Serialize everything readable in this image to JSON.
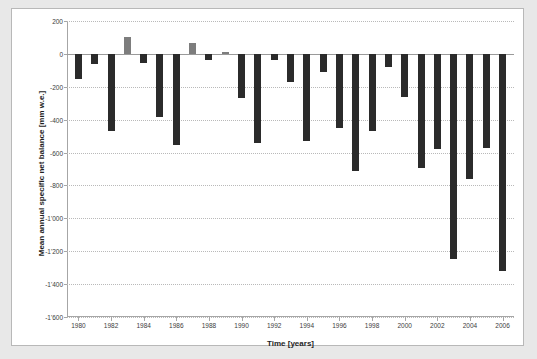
{
  "chart_data": {
    "type": "bar",
    "title": "",
    "xlabel": "Time [years]",
    "ylabel": "Mean annual specific net balance [mm w.e.]",
    "xlim": [
      1979.3,
      2006.7
    ],
    "ylim": [
      -1600,
      200
    ],
    "grid": true,
    "legend": "none",
    "y_ticks": [
      200,
      0,
      -200,
      -400,
      -600,
      -800,
      -1000,
      -1200,
      -1400,
      -1600
    ],
    "y_tick_labels": [
      "200",
      "0",
      "-200",
      "-400",
      "-600",
      "-800",
      "-1'000",
      "-1'200",
      "-1'400",
      "-1'600"
    ],
    "x_ticks": [
      1980,
      1982,
      1984,
      1986,
      1988,
      1990,
      1992,
      1994,
      1996,
      1998,
      2000,
      2002,
      2004,
      2006
    ],
    "x_tick_labels": [
      "1980",
      "1982",
      "1984",
      "1986",
      "1988",
      "1990",
      "1992",
      "1994",
      "1996",
      "1998",
      "2000",
      "2002",
      "2004",
      "2006"
    ],
    "categories": [
      1980,
      1981,
      1982,
      1983,
      1984,
      1985,
      1986,
      1987,
      1988,
      1989,
      1990,
      1991,
      1992,
      1993,
      1994,
      1995,
      1996,
      1997,
      1998,
      1999,
      2000,
      2001,
      2002,
      2003,
      2004,
      2005,
      2006
    ],
    "values": [
      -155,
      -60,
      -470,
      105,
      -55,
      -385,
      -555,
      65,
      -35,
      10,
      -270,
      -545,
      -35,
      -170,
      -530,
      -110,
      -450,
      -715,
      -470,
      -80,
      -260,
      -695,
      -580,
      -1250,
      -760,
      -575,
      -1320
    ],
    "bar_colors": {
      "negative": "#2b2b2b",
      "positive": "#7d7d7d"
    }
  },
  "figure": {
    "background": "#e8e8e8",
    "panel_background": "#ffffff",
    "border_color": "#b8b8b8"
  }
}
